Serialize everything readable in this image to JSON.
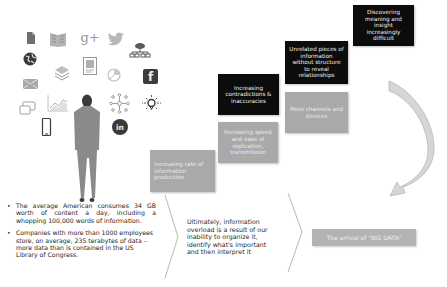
{
  "illustration": {
    "figure": "businessman-silhouette",
    "icons": [
      {
        "name": "document-icon",
        "glyph": "▙"
      },
      {
        "name": "newspaper-icon",
        "glyph": "▦"
      },
      {
        "name": "google-plus-icon",
        "glyph": "g+"
      },
      {
        "name": "twitter-icon",
        "glyph": "🐦"
      },
      {
        "name": "cloud-network-icon",
        "glyph": "☁"
      },
      {
        "name": "globe-icon",
        "glyph": "◉"
      },
      {
        "name": "layers-icon",
        "glyph": "≋"
      },
      {
        "name": "image-frame-icon",
        "glyph": "▣"
      },
      {
        "name": "pie-chart-icon",
        "glyph": "◔"
      },
      {
        "name": "facebook-icon",
        "glyph": "f"
      },
      {
        "name": "mail-icon",
        "glyph": "✉"
      },
      {
        "name": "chat-icon",
        "glyph": "▭"
      },
      {
        "name": "line-chart-icon",
        "glyph": "📈"
      },
      {
        "name": "network-icon",
        "glyph": "✣"
      },
      {
        "name": "lightbulb-icon",
        "glyph": "✹"
      },
      {
        "name": "smartphone-icon",
        "glyph": "▯"
      },
      {
        "name": "linkedin-icon",
        "glyph": "in"
      }
    ]
  },
  "facts": [
    "The average American consumes 34 GB worth of content a day, including a whopping 100,000 words of information.",
    "Companies with more than 1000 employees store, on average, 235 terabytes of data – more data than is contained in the US Library of Congress."
  ],
  "steps": {
    "gray": [
      "Increasing rate of information production",
      "Increasing speed and ease of replication, transmission",
      "More channels and devices"
    ],
    "black": [
      "Increasing contradictions & inaccuracies",
      "Unrelated pieces of information without structure to reveal relationships",
      "Discovering meaning and insight increasingly difficult"
    ]
  },
  "summary": "Ultimately, information overload is a result of our inability to organize it, identify what's important and then interpret it",
  "conclusion": "The arrival of \"BIG DATA\"",
  "colors": {
    "gray_box": "#a9a9a9",
    "black_box": "#0c0c0c",
    "icon": "#8a8a8a",
    "arrow_stroke": "#b0b0b0"
  }
}
